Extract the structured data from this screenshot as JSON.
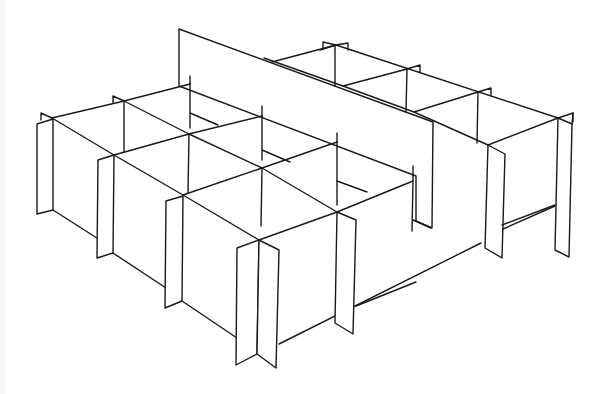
{
  "figure": {
    "style": "black line art on white background",
    "colors": {
      "line": "#1a1a1a",
      "background": "#ffffff",
      "edge_strip": "#f7f7f7"
    }
  }
}
